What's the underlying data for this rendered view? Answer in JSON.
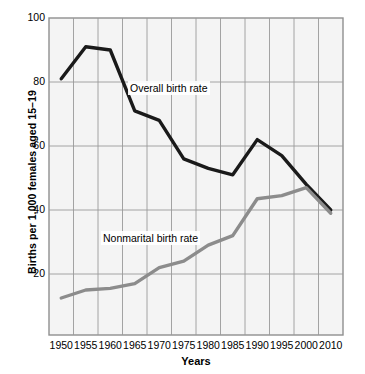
{
  "chart_data": {
    "type": "line",
    "title": "",
    "xlabel": "Years",
    "ylabel": "Births per 1,000 females aged 15–19",
    "x": [
      1950,
      1955,
      1960,
      1965,
      1970,
      1975,
      1980,
      1985,
      1990,
      1995,
      2000,
      2010
    ],
    "xlim": [
      1948,
      2012
    ],
    "ylim": [
      1,
      100
    ],
    "yticks": [
      20,
      40,
      60,
      80,
      100
    ],
    "ytick_labels": [
      "20",
      "40",
      "60",
      "80",
      "100"
    ],
    "xtick_labels": [
      "1950",
      "1955",
      "1960",
      "1965",
      "1970",
      "1975",
      "1980",
      "1985",
      "1990",
      "1995",
      "2000",
      "2010"
    ],
    "grid": true,
    "legend_position": "inline-annotations",
    "series": [
      {
        "name": "Overall birth rate",
        "color": "#1a1a1a",
        "width": 3.4,
        "values": [
          81,
          91,
          90,
          71,
          68,
          56,
          53,
          51,
          62,
          57,
          48,
          40
        ]
      },
      {
        "name": "Nonmarital birth rate",
        "color": "#8c8c8c",
        "width": 3.4,
        "values": [
          12.5,
          15,
          15.5,
          17,
          22,
          24,
          29,
          32,
          43.5,
          44.5,
          47,
          39
        ]
      }
    ],
    "annotations": [
      {
        "id": "overall",
        "text": "Overall birth rate"
      },
      {
        "id": "nonmarital",
        "text": "Nonmarital birth rate"
      }
    ]
  }
}
